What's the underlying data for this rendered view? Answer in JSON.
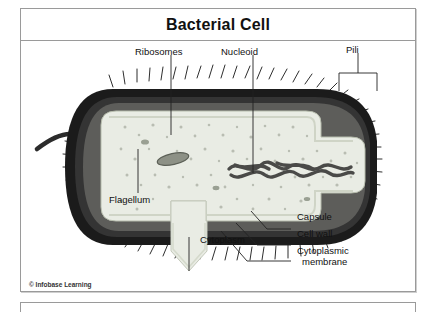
{
  "figure": {
    "title": "Bacterial Cell",
    "copyright": "© Infobase Learning"
  },
  "labels": {
    "ribosomes": "Ribosomes",
    "nucleoid": "Nucleoid",
    "pili": "Pili",
    "flagellum": "Flagellum",
    "cytoplasm": "Cytoplasm",
    "capsule": "Capsule",
    "cell_wall": "Cell wall",
    "cytoplasmic_membrane_line1": "Cytoplasmic",
    "cytoplasmic_membrane_line2": "membrane"
  },
  "colors": {
    "frame": "#9a9a9a",
    "capsule_dark": "#1b1b1b",
    "cell_wall": "#3a3a3a",
    "cytoplasm": "#e9ece4",
    "cytoplasm_edge": "#c8cdc0",
    "nucleoid": "#4a4a48",
    "ribosome_dot": "#b9bdb2",
    "flagellum": "#2c2c2c",
    "leader": "#222222",
    "text": "#111111"
  }
}
